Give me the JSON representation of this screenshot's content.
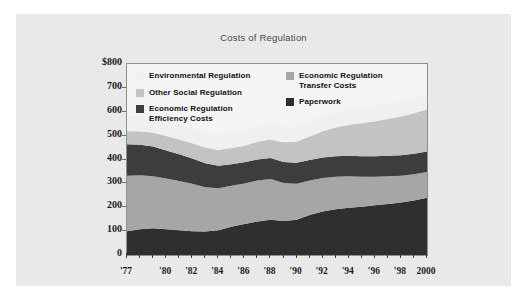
{
  "figure": {
    "background_color": "#e9e9e9",
    "outer_background_color": "#ffffff"
  },
  "chart_data": {
    "type": "area",
    "stacked": true,
    "title": "Costs of Regulation",
    "xlabel": "",
    "ylabel": "",
    "ylim": [
      0,
      800
    ],
    "yticks": [
      0,
      100,
      200,
      300,
      400,
      500,
      600,
      700,
      800
    ],
    "ytick_labels": [
      "0",
      "100",
      "200",
      "300",
      "400",
      "500",
      "600",
      "700",
      "$800"
    ],
    "grid": false,
    "legend_position": "upper-left-inside",
    "x": [
      1977,
      1978,
      1979,
      1980,
      1981,
      1982,
      1983,
      1984,
      1985,
      1986,
      1987,
      1988,
      1989,
      1990,
      1991,
      1992,
      1993,
      1994,
      1995,
      1996,
      1997,
      1998,
      1999,
      2000
    ],
    "xtick_labels": [
      "'77",
      "'80",
      "'82",
      "'84",
      "'86",
      "'88",
      "'90",
      "'92",
      "'94",
      "'96",
      "'98",
      "2000"
    ],
    "xtick_values": [
      1977,
      1980,
      1982,
      1984,
      1986,
      1988,
      1990,
      1992,
      1994,
      1996,
      1998,
      2000
    ],
    "series": [
      {
        "name": "Paperwork",
        "color": "#2f2f2f",
        "values": [
          100,
          108,
          112,
          108,
          104,
          100,
          98,
          104,
          118,
          130,
          140,
          148,
          142,
          148,
          168,
          182,
          192,
          198,
          202,
          208,
          214,
          220,
          228,
          240
        ]
      },
      {
        "name": "Economic Regulation Transfer Costs",
        "color": "#a6a6a6",
        "values": [
          232,
          226,
          218,
          212,
          206,
          198,
          186,
          176,
          172,
          170,
          172,
          170,
          160,
          150,
          144,
          140,
          136,
          132,
          126,
          120,
          116,
          112,
          110,
          108
        ]
      },
      {
        "name": "Economic Regulation Efficiency Costs",
        "color": "#3d3d3d",
        "values": [
          132,
          128,
          124,
          118,
          112,
          106,
          100,
          94,
          90,
          88,
          88,
          88,
          88,
          88,
          86,
          86,
          86,
          86,
          86,
          86,
          86,
          86,
          86,
          86
        ]
      },
      {
        "name": "Other Social Regulation",
        "color": "#c3c3c3",
        "values": [
          54,
          56,
          58,
          60,
          62,
          64,
          66,
          66,
          68,
          70,
          74,
          78,
          82,
          88,
          98,
          110,
          120,
          130,
          138,
          146,
          154,
          162,
          170,
          176
        ]
      },
      {
        "name": "Environmental Regulation",
        "color": "#f0f0f0",
        "values": [
          64,
          64,
          64,
          64,
          64,
          64,
          64,
          64,
          64,
          64,
          64,
          64,
          64,
          64,
          64,
          64,
          64,
          64,
          64,
          64,
          64,
          64,
          64,
          64
        ]
      }
    ],
    "legend": [
      {
        "label_line1": "Environmental Regulation",
        "label_line2": "",
        "color": "#f0f0f0",
        "column": "left"
      },
      {
        "label_line1": "Other Social Regulation",
        "label_line2": "",
        "color": "#c3c3c3",
        "column": "left"
      },
      {
        "label_line1": "Economic Regulation",
        "label_line2": "Efficiency Costs",
        "color": "#3d3d3d",
        "column": "left"
      },
      {
        "label_line1": "Economic Regulation",
        "label_line2": "Transfer Costs",
        "color": "#a6a6a6",
        "column": "right"
      },
      {
        "label_line1": "Paperwork",
        "label_line2": "",
        "color": "#2f2f2f",
        "column": "right"
      }
    ]
  }
}
